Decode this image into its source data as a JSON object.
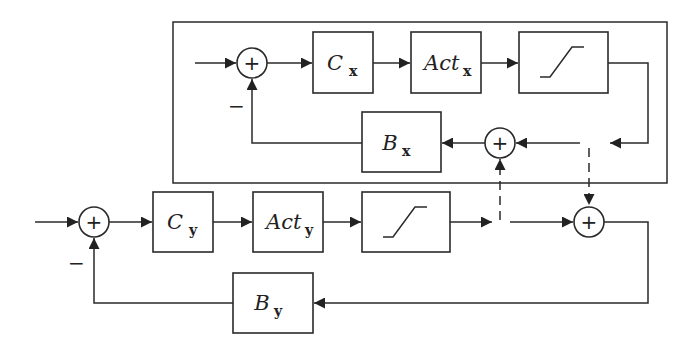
{
  "diagram": {
    "type": "block-diagram",
    "outer_loop_frame": "x-axis loop",
    "x_loop": {
      "controller": {
        "name": "C",
        "subscript": "x"
      },
      "actuator": {
        "name": "Act",
        "subscript": "x"
      },
      "saturation_icon": "saturation",
      "feedback": {
        "name": "B",
        "subscript": "x"
      },
      "sum_sign": "+",
      "feedback_sign": "−",
      "coupling_sum_sign": "+"
    },
    "y_loop": {
      "controller": {
        "name": "C",
        "subscript": "y"
      },
      "actuator": {
        "name": "Act",
        "subscript": "y"
      },
      "saturation_icon": "saturation",
      "feedback": {
        "name": "B",
        "subscript": "y"
      },
      "sum_sign": "+",
      "feedback_sign": "−",
      "coupling_sum_sign": "+"
    }
  }
}
